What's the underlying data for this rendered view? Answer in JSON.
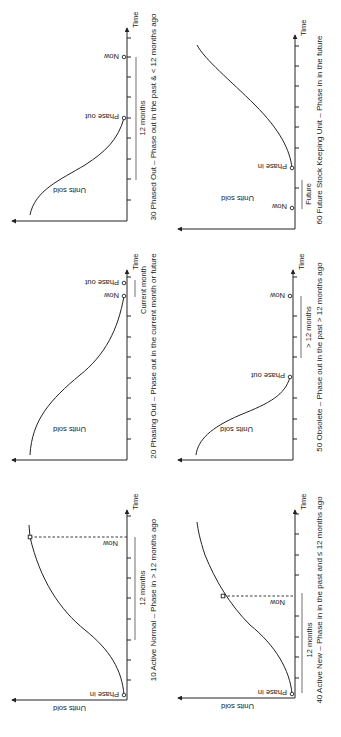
{
  "figure": {
    "orientation": "rotated 90 degrees counter-clockwise",
    "axis_labels": {
      "y": "Units sold",
      "x": "Time"
    },
    "panels": [
      {
        "id": "10",
        "caption": "10 Active Normal – Phase in  > 12 months ago",
        "curve": "s-curve rising",
        "markers": [
          {
            "label": "Phase in"
          },
          {
            "label": "Now"
          }
        ],
        "span_label": "12 months"
      },
      {
        "id": "20",
        "caption": "20 Phasing Out – Phase out in the current month or future",
        "curve": "s-curve falling",
        "markers": [
          {
            "label": "Now"
          },
          {
            "label": "Phase out"
          }
        ],
        "span_label": "Current month"
      },
      {
        "id": "30",
        "caption": "30 Phased Out – Phase out in the past & < 12 months ago",
        "curve": "s-curve falling",
        "markers": [
          {
            "label": "Phase out"
          },
          {
            "label": "Now"
          }
        ],
        "span_label": "12 months"
      },
      {
        "id": "40",
        "caption": "40 Active New – Phase in in the past and ≤ 12 months ago",
        "curve": "s-curve rising",
        "markers": [
          {
            "label": "Phase in"
          },
          {
            "label": "Now"
          }
        ],
        "span_label": "12 months"
      },
      {
        "id": "50",
        "caption": "50 Obsolete – Phase out in the past > 12 months ago",
        "curve": "s-curve falling",
        "markers": [
          {
            "label": "Phase out"
          },
          {
            "label": "Now"
          }
        ],
        "span_label": "> 12 months"
      },
      {
        "id": "60",
        "caption": "60 Future Stock Keeping Unit – Phase in in the future",
        "curve": "s-curve rising",
        "markers": [
          {
            "label": "Now"
          },
          {
            "label": "Phase in"
          }
        ],
        "span_label": "Future"
      }
    ]
  }
}
